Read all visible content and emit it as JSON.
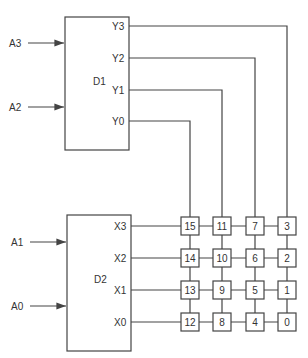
{
  "decoders": [
    {
      "id": "D1",
      "label": "D1",
      "inputs": [
        "A3",
        "A2"
      ],
      "outputs": [
        "Y3",
        "Y2",
        "Y1",
        "Y0"
      ]
    },
    {
      "id": "D2",
      "label": "D2",
      "inputs": [
        "A1",
        "A0"
      ],
      "outputs": [
        "X3",
        "X2",
        "X1",
        "X0"
      ]
    }
  ],
  "grid": {
    "rows": [
      [
        "15",
        "11",
        "7",
        "3"
      ],
      [
        "14",
        "10",
        "6",
        "2"
      ],
      [
        "13",
        "9",
        "5",
        "1"
      ],
      [
        "12",
        "8",
        "4",
        "0"
      ]
    ]
  },
  "colors": {
    "line": "#444444",
    "text": "#333333",
    "background": "#ffffff"
  }
}
